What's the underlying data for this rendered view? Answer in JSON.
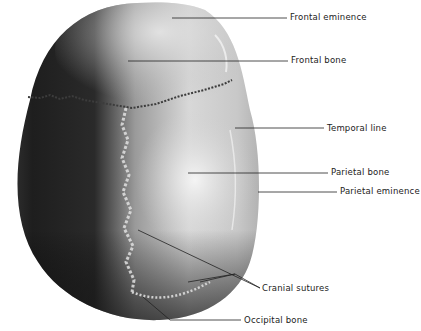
{
  "figure": {
    "labels": [
      {
        "id": "frontal-eminence",
        "text": "Frontal eminence",
        "x": 290,
        "y": 12
      },
      {
        "id": "frontal-bone",
        "text": "Frontal bone",
        "x": 291,
        "y": 55
      },
      {
        "id": "temporal-line",
        "text": "Temporal line",
        "x": 327,
        "y": 123
      },
      {
        "id": "parietal-bone",
        "text": "Parietal bone",
        "x": 331,
        "y": 167
      },
      {
        "id": "parietal-eminence",
        "text": "Parietal eminence",
        "x": 340,
        "y": 186
      },
      {
        "id": "cranial-sutures",
        "text": "Cranial sutures",
        "x": 262,
        "y": 283
      },
      {
        "id": "occipital-bone",
        "text": "Occipital bone",
        "x": 244,
        "y": 317
      }
    ]
  }
}
